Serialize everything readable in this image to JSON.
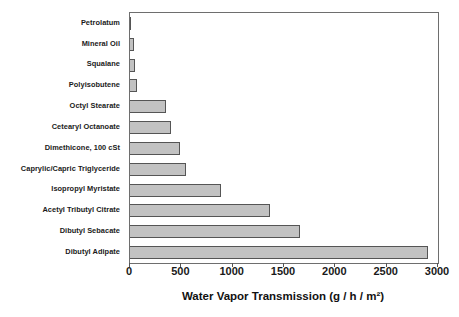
{
  "chart_data": {
    "type": "bar",
    "orientation": "horizontal",
    "title": "",
    "xlabel": "Water Vapor Transmission (g / h / m²)",
    "ylabel": "",
    "xlim": [
      0,
      3000
    ],
    "xticks": [
      0,
      500,
      1000,
      1500,
      2000,
      2500,
      3000
    ],
    "xticklabels": [
      "0",
      "500",
      "1000",
      "1500",
      "2000",
      "2500",
      "3000"
    ],
    "grid": false,
    "legend": null,
    "categories": [
      "Petrolatum",
      "Mineral Oil",
      "Squalane",
      "Polyisobutene",
      "Octyl Stearate",
      "Cetearyl Octanoate",
      "Dimethicone, 100 cSt",
      "Caprylic/Capric Triglyceride",
      "Isopropyl Myristate",
      "Acetyl Tributyl Citrate",
      "Dibutyl Sebacate",
      "Dibutyl Adipate"
    ],
    "values": [
      10,
      40,
      50,
      65,
      355,
      395,
      490,
      545,
      890,
      1360,
      1655,
      2900
    ],
    "bar_fill_color": "#c2c2c2",
    "bar_edge_color": "#555555",
    "axis_color": "#6e6e6e",
    "text_color": "#1a1a1a"
  }
}
